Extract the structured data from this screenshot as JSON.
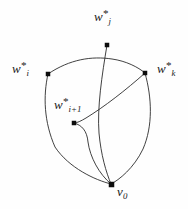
{
  "figure": {
    "background_color": "#fefefe",
    "stroke_color": "#2b2b2b",
    "node_color": "#0d0d0d",
    "width": 188,
    "height": 209
  },
  "nodes": [
    {
      "id": "wj",
      "base": "w",
      "subscript": "j",
      "superscript": "*",
      "x": 107,
      "y": 45
    },
    {
      "id": "wi",
      "base": "w",
      "subscript": "i",
      "superscript": "*",
      "x": 48,
      "y": 74
    },
    {
      "id": "wk",
      "base": "w",
      "subscript": "k",
      "superscript": "*",
      "x": 145,
      "y": 73
    },
    {
      "id": "wi1",
      "base": "w",
      "subscript": "i+1",
      "superscript": "*",
      "x": 74,
      "y": 123
    },
    {
      "id": "v0",
      "base": "v",
      "subscript": "0",
      "superscript": "",
      "x": 111,
      "y": 184
    }
  ],
  "labels": {
    "wj": {
      "base": "w",
      "sub": "j",
      "sup": "*"
    },
    "wi": {
      "base": "w",
      "sub": "i",
      "sup": "*"
    },
    "wk": {
      "base": "w",
      "sub": "k",
      "sup": "*"
    },
    "wi1": {
      "base": "w",
      "sub": "i+1",
      "sup": "*"
    },
    "v0": {
      "base": "v",
      "sub": "0",
      "sup": ""
    }
  },
  "edges": [
    {
      "name": "edge-wi-to-wk-top-arc",
      "from": "wi",
      "to": "wk"
    },
    {
      "name": "edge-wj-to-v0",
      "from": "wj",
      "to": "v0"
    },
    {
      "name": "edge-wi-to-v0-left",
      "from": "wi",
      "to": "v0"
    },
    {
      "name": "edge-wk-to-v0-right",
      "from": "wk",
      "to": "v0"
    },
    {
      "name": "edge-wk-to-wi1-chord",
      "from": "wk",
      "to": "wi1"
    },
    {
      "name": "edge-wi1-to-v0",
      "from": "wi1",
      "to": "v0"
    }
  ]
}
